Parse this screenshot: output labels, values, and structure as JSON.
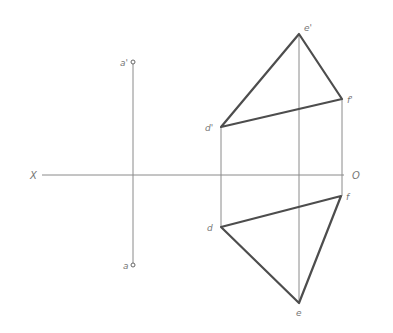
{
  "diagram": {
    "type": "orthographic-projection",
    "axis": {
      "left_label": "X",
      "right_label": "O"
    },
    "point_a": {
      "front_label": "a'",
      "top_label": "a"
    },
    "triangle": {
      "front_labels": {
        "d": "d'",
        "e": "e'",
        "f": "f'"
      },
      "top_labels": {
        "d": "d",
        "e": "e",
        "f": "f"
      }
    },
    "colors": {
      "thin_line": "#8a8a8a",
      "thick_line": "#4d4d4d",
      "label": "#777777"
    }
  }
}
